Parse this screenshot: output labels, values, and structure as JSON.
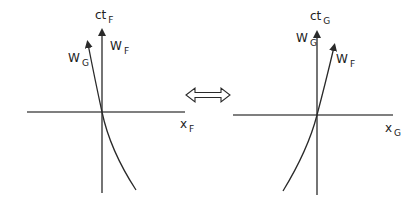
{
  "left_diagram": {
    "time_axis": {
      "main": "ct",
      "sub": "F"
    },
    "space_axis": {
      "main": "x",
      "sub": "F"
    },
    "worldline_straight": {
      "main": "W",
      "sub": "F"
    },
    "worldline_curved": {
      "main": "W",
      "sub": "G"
    }
  },
  "right_diagram": {
    "time_axis": {
      "main": "ct",
      "sub": "G"
    },
    "space_axis": {
      "main": "x",
      "sub": "G"
    },
    "worldline_straight": {
      "main": "W",
      "sub": "G"
    },
    "worldline_curved": {
      "main": "W",
      "sub": "F"
    }
  },
  "connector": {
    "symbol": "double-arrow"
  },
  "colors": {
    "stroke": "#2a2a2a",
    "background": "#ffffff"
  }
}
